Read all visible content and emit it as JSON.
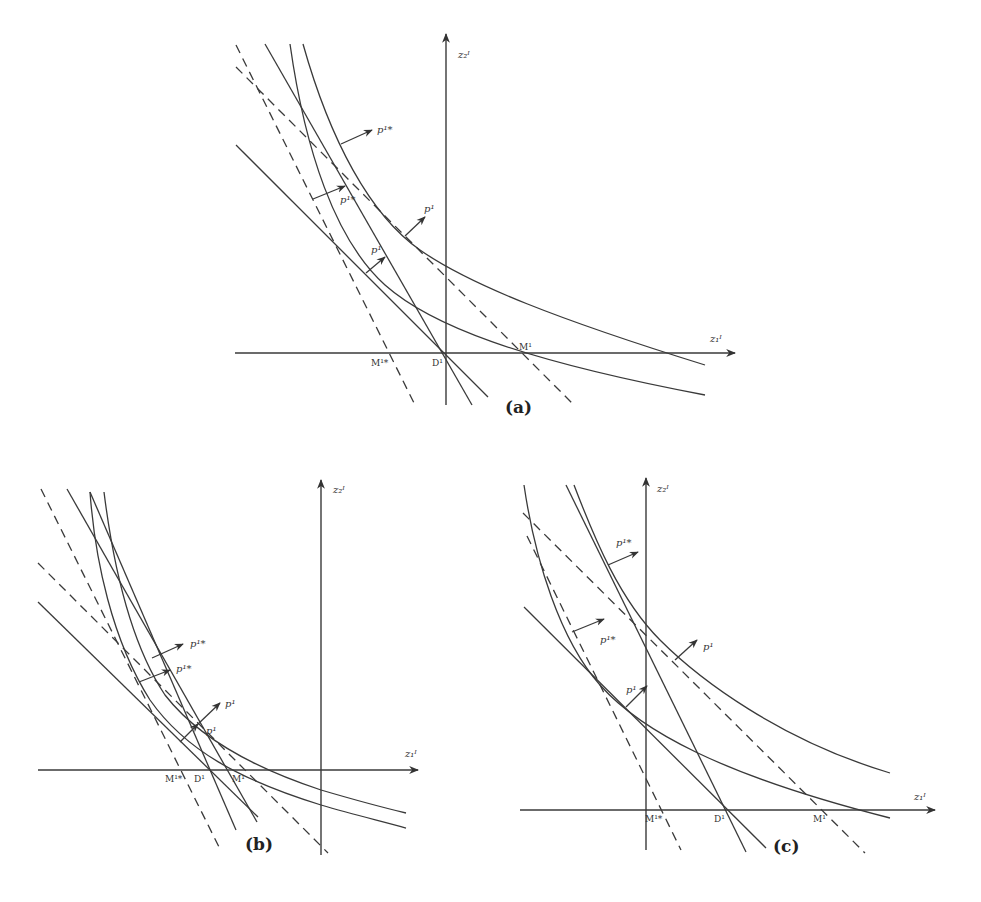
{
  "figure": {
    "panels": [
      {
        "id": "a",
        "caption": "(a)",
        "axes": {
          "x_label": "z₁ᴵ",
          "y_label": "z₂ᴵ"
        },
        "points": {
          "M_star": "M¹*",
          "D": "D¹",
          "M": "M¹"
        },
        "arrows": {
          "p_star_upper": "p¹*",
          "p_star_lower": "p¹*",
          "p_upper": "p¹",
          "p_lower": "p¹"
        }
      },
      {
        "id": "b",
        "caption": "(b)",
        "axes": {
          "x_label": "z₁ᴵ",
          "y_label": "z₂ᴵ"
        },
        "points": {
          "M_star": "M¹*",
          "D": "D¹",
          "M": "M¹"
        },
        "arrows": {
          "p_star_upper": "p¹*",
          "p_star_lower": "p¹*",
          "p_upper": "p¹",
          "p_lower": "p¹"
        }
      },
      {
        "id": "c",
        "caption": "(c)",
        "axes": {
          "x_label": "z₁ᴵ",
          "y_label": "z₂ᴵ"
        },
        "points": {
          "M_star": "M¹*",
          "D": "D¹",
          "M": "M¹"
        },
        "arrows": {
          "p_star_upper": "p¹*",
          "p_star_lower": "p¹*",
          "p_upper": "p¹",
          "p_lower": "p¹"
        }
      }
    ]
  }
}
